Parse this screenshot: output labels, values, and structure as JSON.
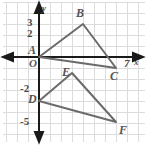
{
  "figure": {
    "type": "coordinate-geometry-diagram",
    "colors": {
      "background": "#ffffff",
      "grid": "#dcdcdc",
      "axis": "#1a1a1a",
      "shape_stroke": "#6b6b6b",
      "label": "#555555"
    }
  },
  "axes": {
    "x_axis_label": "x",
    "y_axis_label": "y",
    "origin_label": "O",
    "x_ticks": [
      {
        "label": "7",
        "value": 7
      }
    ],
    "y_ticks": [
      {
        "label": "3",
        "value": 3
      },
      {
        "label": "2",
        "value": 2
      },
      {
        "label": "-2",
        "value": -2
      },
      {
        "label": "-5",
        "value": -5
      }
    ]
  },
  "points": [
    {
      "name": "A",
      "label": "A",
      "x": 0,
      "y": 0
    },
    {
      "name": "B",
      "label": "B",
      "x": 4,
      "y": 3
    },
    {
      "name": "C",
      "label": "C",
      "x": 7,
      "y": -1
    },
    {
      "name": "D",
      "label": "D",
      "x": 0,
      "y": -4
    },
    {
      "name": "E",
      "label": "E",
      "x": 3,
      "y": -1.5
    },
    {
      "name": "F",
      "label": "F",
      "x": 7,
      "y": -5
    }
  ],
  "shapes": [
    {
      "name": "triangle-ABC",
      "vertices": [
        "A",
        "B",
        "C"
      ]
    },
    {
      "name": "triangle-DEF",
      "vertices": [
        "D",
        "E",
        "F"
      ]
    }
  ]
}
